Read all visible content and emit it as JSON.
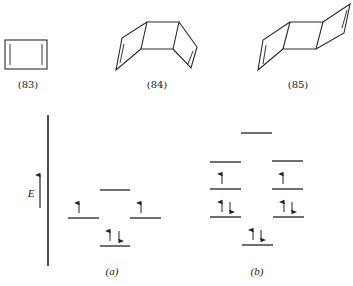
{
  "molecules": [
    {
      "id": "83",
      "label": "(83)"
    },
    {
      "id": "84",
      "label": "(84)"
    },
    {
      "id": "85",
      "label": "(85)"
    }
  ],
  "energy_diagram": {
    "axis_label": "E",
    "panels": [
      {
        "label": "(a)",
        "levels": [
          {
            "position": "top",
            "electrons": ""
          },
          {
            "position": "middle-left",
            "electrons": "↑"
          },
          {
            "position": "middle-right",
            "electrons": "↑"
          },
          {
            "position": "bottom",
            "electrons": "↑↓"
          }
        ]
      },
      {
        "label": "(b)",
        "levels": [
          {
            "position": "top",
            "electrons": ""
          },
          {
            "position": "upper-left",
            "electrons": ""
          },
          {
            "position": "upper-right",
            "electrons": ""
          },
          {
            "position": "middle-left",
            "electrons": "↑"
          },
          {
            "position": "middle-right",
            "electrons": "↑"
          },
          {
            "position": "lower-left",
            "electrons": "↑↓"
          },
          {
            "position": "lower-right",
            "electrons": "↑↓"
          },
          {
            "position": "bottom",
            "electrons": "↑↓"
          }
        ]
      }
    ]
  },
  "colors": {
    "ink": "#222222",
    "background": "#ffffff"
  }
}
